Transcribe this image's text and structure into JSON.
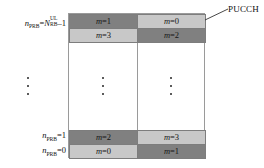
{
  "figure": {
    "callout": {
      "label": "PUCCH"
    },
    "colors": {
      "dark_cell": "#808080",
      "light_cell": "#c8c8c8",
      "grid_border": "#9a9a9a",
      "cell_border": "#7d7d7d",
      "background": "#ffffff",
      "text": "#111111"
    },
    "axis_labels": [
      {
        "id": "top",
        "variable": "n",
        "subscript": "PRB",
        "equals": "=",
        "rhs_variable": "N",
        "rhs_subscript": "RB",
        "rhs_superscript": "UL",
        "tail": "–1",
        "text": "n_PRB=N_RB^UL–1"
      },
      {
        "id": "one",
        "variable": "n",
        "subscript": "PRB",
        "equals": "=",
        "tail": "1",
        "text": "n_PRB=1"
      },
      {
        "id": "zero",
        "variable": "n",
        "subscript": "PRB",
        "equals": "=",
        "tail": "0",
        "text": "n_PRB=0"
      }
    ],
    "rows": [
      {
        "id": "row-top-1",
        "left": {
          "shade": "dark",
          "var": "m",
          "eq": "=",
          "value": "1"
        },
        "right": {
          "shade": "light",
          "var": "m",
          "eq": "=",
          "value": "0"
        }
      },
      {
        "id": "row-top-2",
        "left": {
          "shade": "light",
          "var": "m",
          "eq": "=",
          "value": "3"
        },
        "right": {
          "shade": "dark",
          "var": "m",
          "eq": "=",
          "value": "2"
        }
      },
      {
        "id": "row-bottom-2",
        "left": {
          "shade": "dark",
          "var": "m",
          "eq": "=",
          "value": "2"
        },
        "right": {
          "shade": "light",
          "var": "m",
          "eq": "=",
          "value": "3"
        }
      },
      {
        "id": "row-bottom-1",
        "left": {
          "shade": "light",
          "var": "m",
          "eq": "=",
          "value": "0"
        },
        "right": {
          "shade": "dark",
          "var": "m",
          "eq": "=",
          "value": "1"
        }
      }
    ],
    "ellipses": [
      {
        "id": "ellipsis-axis",
        "position": "left-axis"
      },
      {
        "id": "ellipsis-left-column",
        "position": "left-column"
      },
      {
        "id": "ellipsis-right-column",
        "position": "right-column"
      }
    ]
  }
}
